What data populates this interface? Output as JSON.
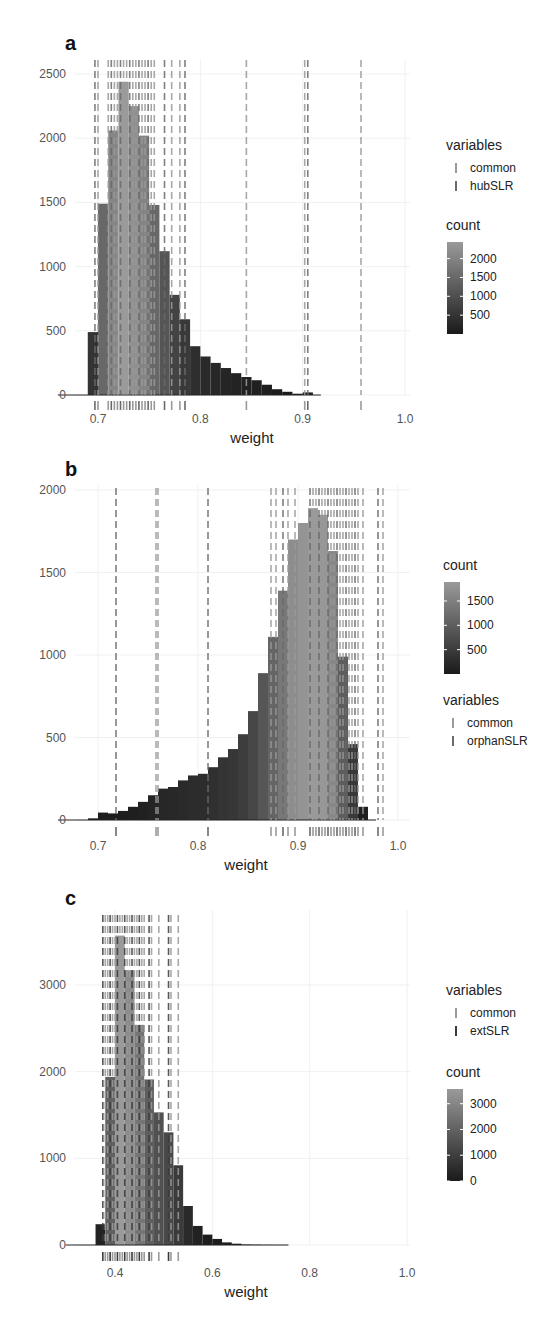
{
  "chart_data": [
    {
      "panel": "a",
      "type": "bar",
      "subtype": "histogram_with_rug",
      "title": "",
      "xlabel": "weight",
      "ylabel": "",
      "xlim": [
        0.68,
        1.0
      ],
      "ylim": [
        0,
        2500
      ],
      "xticks": [
        "0.7",
        "0.8",
        "0.9",
        "1.0"
      ],
      "yticks": [
        "0",
        "500",
        "1000",
        "1500",
        "2000",
        "2500"
      ],
      "grid": true,
      "bin_width": 0.01,
      "bin_start": 0.69,
      "values": [
        490,
        1490,
        2060,
        2440,
        2250,
        2020,
        1480,
        1120,
        780,
        590,
        380,
        300,
        250,
        210,
        170,
        140,
        115,
        80,
        45,
        25,
        10,
        20
      ],
      "fill_scale": {
        "title": "count",
        "ticks": [
          "2000",
          "1500",
          "1000",
          "500"
        ],
        "tick_values": [
          2000,
          1500,
          1000,
          500
        ],
        "range": [
          0,
          2440
        ],
        "low_color": "#1a1a1a",
        "high_color": "#9a9a9a"
      },
      "rug_legend": {
        "title": "variables",
        "items": [
          {
            "label": "common",
            "color": "#9a9a9a"
          },
          {
            "label": "hubSLR",
            "color": "#6a6a6a"
          }
        ]
      },
      "rug_positions": [
        0.697,
        0.7,
        0.71,
        0.713,
        0.716,
        0.719,
        0.722,
        0.725,
        0.728,
        0.731,
        0.734,
        0.737,
        0.74,
        0.743,
        0.746,
        0.749,
        0.752,
        0.755,
        0.765,
        0.772,
        0.78,
        0.785,
        0.845,
        0.902,
        0.905,
        0.957
      ]
    },
    {
      "panel": "b",
      "type": "bar",
      "subtype": "histogram_with_rug",
      "title": "",
      "xlabel": "weight",
      "ylabel": "",
      "xlim": [
        0.68,
        1.01
      ],
      "ylim": [
        0,
        2000
      ],
      "xticks": [
        "0.7",
        "0.8",
        "0.9",
        "1.0"
      ],
      "yticks": [
        "0",
        "500",
        "1000",
        "1500",
        "2000"
      ],
      "grid": true,
      "bin_width": 0.01,
      "bin_start": 0.69,
      "values": [
        10,
        45,
        40,
        55,
        80,
        110,
        150,
        190,
        200,
        240,
        270,
        280,
        320,
        380,
        430,
        520,
        660,
        890,
        1110,
        1390,
        1700,
        1800,
        1890,
        1850,
        1630,
        990,
        460,
        80
      ],
      "fill_scale": {
        "title": "count",
        "ticks": [
          "1500",
          "1000",
          "500"
        ],
        "tick_values": [
          1500,
          1000,
          500
        ],
        "range": [
          0,
          1890
        ],
        "low_color": "#1a1a1a",
        "high_color": "#9a9a9a"
      },
      "rug_legend": {
        "title": "variables",
        "items": [
          {
            "label": "common",
            "color": "#9a9a9a"
          },
          {
            "label": "orphanSLR",
            "color": "#6a6a6a"
          }
        ]
      },
      "rug_positions": [
        0.718,
        0.758,
        0.76,
        0.81,
        0.873,
        0.878,
        0.885,
        0.89,
        0.897,
        0.912,
        0.915,
        0.918,
        0.921,
        0.924,
        0.927,
        0.93,
        0.933,
        0.936,
        0.939,
        0.942,
        0.945,
        0.948,
        0.951,
        0.954,
        0.957,
        0.96,
        0.965,
        0.98,
        0.985
      ]
    },
    {
      "panel": "c",
      "type": "bar",
      "subtype": "histogram_with_rug",
      "title": "",
      "xlabel": "weight",
      "ylabel": "",
      "xlim": [
        0.34,
        1.0
      ],
      "ylim": [
        0,
        3700
      ],
      "xticks": [
        "0.4",
        "0.6",
        "0.8",
        "1.0"
      ],
      "yticks": [
        "0",
        "1000",
        "2000",
        "3000"
      ],
      "grid": true,
      "bin_width": 0.02,
      "bin_start": 0.36,
      "values": [
        240,
        1940,
        3570,
        3170,
        2540,
        1910,
        1530,
        1300,
        920,
        450,
        220,
        120,
        70,
        30,
        15,
        5,
        3,
        1,
        0
      ],
      "fill_scale": {
        "title": "count",
        "ticks": [
          "3000",
          "2000",
          "1000",
          "0"
        ],
        "tick_values": [
          3000,
          2000,
          1000,
          0
        ],
        "range": [
          0,
          3570
        ],
        "low_color": "#1a1a1a",
        "high_color": "#9a9a9a"
      },
      "rug_legend": {
        "title": "variables",
        "items": [
          {
            "label": "common",
            "color": "#9a9a9a"
          },
          {
            "label": "extSLR",
            "color": "#3a3a3a"
          }
        ]
      },
      "rug_positions": [
        0.375,
        0.38,
        0.385,
        0.39,
        0.395,
        0.4,
        0.405,
        0.41,
        0.415,
        0.42,
        0.425,
        0.43,
        0.435,
        0.44,
        0.445,
        0.45,
        0.455,
        0.46,
        0.47,
        0.475,
        0.49,
        0.51,
        0.515,
        0.53
      ]
    }
  ],
  "panels": {
    "a": {
      "tag": "a",
      "xlabel": "weight"
    },
    "b": {
      "tag": "b",
      "xlabel": "weight"
    },
    "c": {
      "tag": "c",
      "xlabel": "weight"
    }
  }
}
